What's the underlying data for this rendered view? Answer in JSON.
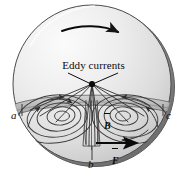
{
  "figure": {
    "kind": "physics-diagram",
    "background_color": "#ffffff",
    "ink_color": "#0b0b0b",
    "disc": {
      "face_color_light": "#f4f4f4",
      "face_color_dark": "#c9c9c9",
      "rim_color": "#8d8d8d",
      "rim_shadow_color": "#6f6f6f",
      "outline_color": "#4a4a4a"
    },
    "pole_band": {
      "fill_color": "#b9b9b9",
      "edge_color": "#5a5a5a"
    },
    "current_loop_color": "#3a3a3a"
  },
  "labels": {
    "eddy_currents": "Eddy currents",
    "point_a": "a",
    "point_b": "b",
    "point_c": "c",
    "field_vector": "B",
    "force_vector": "F"
  },
  "arrows": {
    "rotation_direction": "clockwise",
    "force_direction": "right",
    "rotation_arrow_name": "rotation-arrow",
    "force_arrow_name": "force-arrow"
  },
  "icons": {
    "rotation": "curved-arrow-icon",
    "force": "straight-arrow-icon",
    "apex": "junction-dot-icon"
  }
}
